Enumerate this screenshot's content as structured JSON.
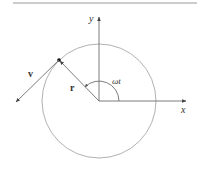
{
  "diagram": {
    "type": "circular-motion",
    "labels": {
      "y_axis": "y",
      "x_axis": "x",
      "position_vector": "r",
      "velocity_vector": "v",
      "angle": "ωt"
    },
    "colors": {
      "line": "#6e6e6e",
      "circle": "#a8a8a8",
      "text": "#333333",
      "rule": "#9a9a9a",
      "point": "#111111"
    }
  }
}
